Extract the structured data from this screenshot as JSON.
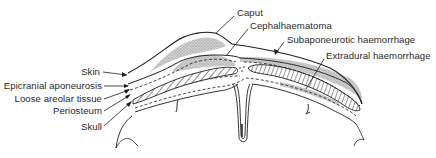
{
  "figure": {
    "type": "anatomical cross-section of neonatal scalp",
    "left_labels": [
      {
        "id": "skin",
        "text": "Skin"
      },
      {
        "id": "epicranial",
        "text": "Epicranial aponeurosis"
      },
      {
        "id": "areolar",
        "text": "Loose areolar tissue"
      },
      {
        "id": "periosteum",
        "text": "Periosteum"
      },
      {
        "id": "skull",
        "text": "Skull"
      }
    ],
    "top_labels": [
      {
        "id": "caput",
        "text": "Caput"
      },
      {
        "id": "cephalhaematoma",
        "text": "Cephalhaematoma"
      },
      {
        "id": "subaponeurotic",
        "text": "Subaponeurotic haemorrhage"
      },
      {
        "id": "extradural",
        "text": "Extradural haemorrhage"
      }
    ],
    "colors": {
      "line": "#1e1e1e",
      "stipple": "#b9b9b9",
      "text": "#2a2a2a",
      "background": "#ffffff"
    }
  }
}
